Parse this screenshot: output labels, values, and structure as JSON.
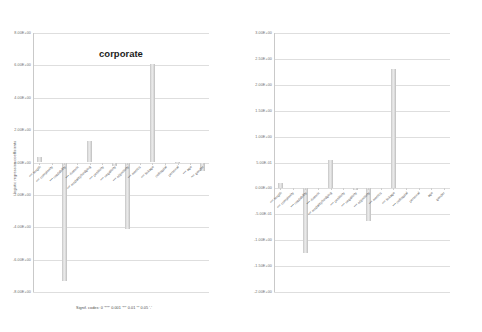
{
  "figure": {
    "signif_note": "Signif. codes:  0 '***' 0.001 '**' 0.01 '*' 0.05 '.'",
    "ylabel": "logistic regression coefficients",
    "bar_color": "#d9d9d9",
    "grid_color": "#dedede"
  },
  "chart_data": [
    {
      "type": "bar",
      "title": "corporate",
      "xlabel": "",
      "ylabel": "logistic regression coefficients",
      "ylim": [
        -8.0,
        8.0
      ],
      "ytick_values": [
        8.0,
        6.0,
        4.0,
        2.0,
        0.0,
        -2.0,
        -4.0,
        -6.0,
        -8.0
      ],
      "ytick_labels": [
        "8.00E+00",
        "6.00E+00",
        "4.00E+00",
        "2.00E+00",
        "0.00E+00",
        "-2.00E+00",
        "-4.00E+00",
        "-6.00E+00",
        "-8.00E+00"
      ],
      "grid": true,
      "legend": "none",
      "categories": [
        "*** length",
        "*** complexity",
        "*** readability",
        "*** rhetoric",
        "*** modality/hedging",
        "*** positivity",
        "*** negativity",
        "*** objectivity",
        "*** metrics",
        "*** linkage",
        "colloquial",
        "personal",
        "*** age",
        "*** gender"
      ],
      "values": [
        0.35,
        0.0,
        -7.3,
        0.0,
        1.3,
        0.05,
        -0.22,
        -4.12,
        0.0,
        6.1,
        0.0,
        0.02,
        0.0,
        -0.52
      ]
    },
    {
      "type": "bar",
      "title": "non-corporate",
      "xlabel": "",
      "ylabel": "logistic regression coefficients",
      "ylim": [
        -2.0,
        3.0
      ],
      "ytick_values": [
        3.0,
        2.5,
        2.0,
        1.5,
        1.0,
        0.5,
        0.0,
        -0.5,
        -1.0,
        -1.5,
        -2.0
      ],
      "ytick_labels": [
        "3.00E+00",
        "2.50E+00",
        "2.00E+00",
        "1.50E+00",
        "1.00E+00",
        "5.00E-01",
        "0.00E+00",
        "-5.00E-01",
        "-1.00E+00",
        "-1.50E+00",
        "-2.00E+00"
      ],
      "grid": true,
      "legend": "none",
      "categories": [
        "*** length",
        "*** complexity",
        "*** readability",
        "*** rhetoric",
        "*** modality/hedging",
        "*** positivity",
        "*** negativity",
        "*** objectivity",
        "*** metrics",
        "*** linkage",
        "*** colloquial",
        "personal",
        "age",
        "gender"
      ],
      "values": [
        0.1,
        0.0,
        -1.25,
        0.0,
        0.55,
        0.0,
        -0.03,
        -0.62,
        0.0,
        2.3,
        0.0,
        0.0,
        0.0,
        0.0
      ]
    }
  ]
}
